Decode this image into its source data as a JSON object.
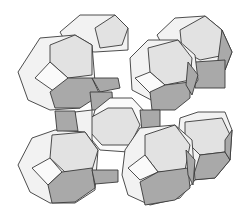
{
  "figure": {
    "colors": {
      "background": "#ffffff",
      "face_light": "#f2f2f2",
      "face_mid": "#e2e2e2",
      "face_dark": "#a9a9a9",
      "edge": "#3a3a3a"
    },
    "cages": [
      {
        "name": "top-left-back",
        "cx": 100,
        "cy": 40
      },
      {
        "name": "top-right-back",
        "cx": 195,
        "cy": 45
      },
      {
        "name": "top-left-front",
        "cx": 65,
        "cy": 75
      },
      {
        "name": "top-right-front",
        "cx": 165,
        "cy": 75
      },
      {
        "name": "center",
        "cx": 115,
        "cy": 125
      },
      {
        "name": "bottom-left",
        "cx": 65,
        "cy": 165
      },
      {
        "name": "bottom-right-back",
        "cx": 210,
        "cy": 155
      },
      {
        "name": "bottom-right-front",
        "cx": 165,
        "cy": 170
      }
    ]
  }
}
